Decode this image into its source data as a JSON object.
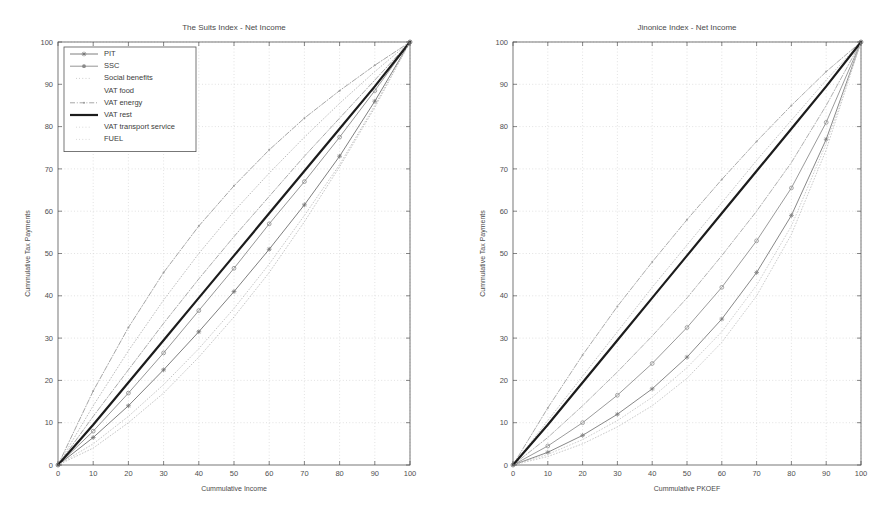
{
  "figure": {
    "width": 887,
    "height": 523,
    "background": "#ffffff"
  },
  "chart_data": [
    {
      "id": "left",
      "type": "line",
      "title": "The Suits Index - Net Income",
      "xlabel": "Cummulative Income",
      "ylabel": "Cummulative Tax Payments",
      "xlim": [
        0,
        100
      ],
      "ylim": [
        0,
        100
      ],
      "xticks": [
        0,
        10,
        20,
        30,
        40,
        50,
        60,
        70,
        80,
        90,
        100
      ],
      "yticks": [
        0,
        10,
        20,
        30,
        40,
        50,
        60,
        70,
        80,
        90,
        100
      ],
      "grid": true,
      "legend_position": "upper-left",
      "x": [
        0,
        10,
        20,
        30,
        40,
        50,
        60,
        70,
        80,
        90,
        100
      ],
      "series": [
        {
          "name": "PIT",
          "color": "#707070",
          "style": "solid",
          "marker": "star",
          "width": 0.9,
          "values": [
            0,
            6.5,
            14.0,
            22.5,
            31.5,
            41.0,
            51.0,
            61.5,
            73.0,
            86.0,
            100
          ]
        },
        {
          "name": "SSC",
          "color": "#8a8a8a",
          "style": "solid",
          "marker": "circle",
          "width": 0.9,
          "values": [
            0,
            8.0,
            17.0,
            26.5,
            36.5,
            46.5,
            57.0,
            67.0,
            77.5,
            88.5,
            100
          ]
        },
        {
          "name": "Social benefits",
          "color": "#b5b5b5",
          "style": "dotted",
          "marker": "none",
          "width": 0.9,
          "values": [
            0,
            14.0,
            27.0,
            39.0,
            50.0,
            60.0,
            69.0,
            77.5,
            85.5,
            93.0,
            100
          ]
        },
        {
          "name": "VAT food",
          "color": "#a0a0a0",
          "style": "dashdot",
          "marker": "none",
          "width": 0.9,
          "values": [
            0,
            11.5,
            22.5,
            33.5,
            44.0,
            54.0,
            63.5,
            73.0,
            82.0,
            91.0,
            100
          ]
        },
        {
          "name": "VAT energy",
          "color": "#9c9c9c",
          "style": "dashdot",
          "marker": "dot",
          "width": 0.9,
          "values": [
            0,
            17.5,
            32.5,
            45.5,
            56.5,
            66.0,
            74.5,
            82.0,
            88.5,
            94.5,
            100
          ]
        },
        {
          "name": "VAT rest",
          "color": "#1c1c1c",
          "style": "solid",
          "marker": "none",
          "width": 2.2,
          "values": [
            0,
            9.5,
            19.5,
            29.5,
            39.5,
            49.5,
            59.5,
            69.5,
            79.5,
            89.5,
            100
          ]
        },
        {
          "name": "VAT transport service",
          "color": "#c0c0c0",
          "style": "dotted",
          "marker": "none",
          "width": 0.9,
          "values": [
            0,
            5.0,
            11.5,
            19.0,
            27.5,
            37.0,
            47.5,
            59.0,
            71.0,
            85.0,
            100
          ]
        },
        {
          "name": "FUEL",
          "color": "#bdbdbd",
          "style": "dotted",
          "marker": "none",
          "width": 0.9,
          "values": [
            0,
            4.0,
            10.0,
            17.0,
            25.5,
            35.0,
            45.5,
            57.5,
            70.5,
            84.5,
            100
          ]
        }
      ]
    },
    {
      "id": "right",
      "type": "line",
      "title": "Jinonice Index - Net Income",
      "xlabel": "Cummulative PKOEF",
      "ylabel": "Cummulative Tax Payments",
      "xlim": [
        0,
        100
      ],
      "ylim": [
        0,
        100
      ],
      "xticks": [
        0,
        10,
        20,
        30,
        40,
        50,
        60,
        70,
        80,
        90,
        100
      ],
      "yticks": [
        0,
        10,
        20,
        30,
        40,
        50,
        60,
        70,
        80,
        90,
        100
      ],
      "grid": true,
      "legend_position": "none",
      "x": [
        0,
        10,
        20,
        30,
        40,
        50,
        60,
        70,
        80,
        90,
        100
      ],
      "series": [
        {
          "name": "PIT",
          "color": "#7a7a7a",
          "style": "solid",
          "marker": "star",
          "width": 0.9,
          "values": [
            0,
            3.0,
            7.0,
            12.0,
            18.0,
            25.5,
            34.5,
            45.5,
            59.0,
            77.0,
            100
          ]
        },
        {
          "name": "SSC",
          "color": "#909090",
          "style": "solid",
          "marker": "circle",
          "width": 0.9,
          "values": [
            0,
            4.5,
            10.0,
            16.5,
            24.0,
            32.5,
            42.0,
            53.0,
            65.5,
            81.0,
            100
          ]
        },
        {
          "name": "Social benefits",
          "color": "#bcbcbc",
          "style": "dotted",
          "marker": "none",
          "width": 0.9,
          "values": [
            0,
            10.5,
            21.0,
            31.5,
            42.0,
            52.0,
            62.0,
            72.0,
            81.5,
            91.0,
            100
          ]
        },
        {
          "name": "VAT food",
          "color": "#a8a8a8",
          "style": "dashdot",
          "marker": "none",
          "width": 0.9,
          "values": [
            0,
            6.5,
            14.0,
            22.0,
            30.5,
            39.5,
            49.5,
            60.0,
            71.5,
            85.0,
            100
          ]
        },
        {
          "name": "VAT energy",
          "color": "#a2a2a2",
          "style": "dashdot",
          "marker": "dot",
          "width": 0.9,
          "values": [
            0,
            13.5,
            26.0,
            37.5,
            48.0,
            58.0,
            67.5,
            76.5,
            85.0,
            93.0,
            100
          ]
        },
        {
          "name": "VAT rest",
          "color": "#1c1c1c",
          "style": "solid",
          "marker": "none",
          "width": 2.2,
          "values": [
            0,
            9.5,
            19.5,
            29.5,
            39.5,
            49.5,
            59.5,
            69.5,
            79.5,
            89.5,
            100
          ]
        },
        {
          "name": "VAT transport service",
          "color": "#c4c4c4",
          "style": "dotted",
          "marker": "none",
          "width": 0.9,
          "values": [
            0,
            2.0,
            5.0,
            9.0,
            14.0,
            20.5,
            29.0,
            40.0,
            54.5,
            74.5,
            100
          ]
        },
        {
          "name": "FUEL",
          "color": "#c8c8c8",
          "style": "dotted",
          "marker": "none",
          "width": 0.9,
          "values": [
            0,
            2.5,
            6.0,
            10.5,
            16.0,
            23.0,
            31.5,
            42.5,
            56.5,
            76.0,
            100
          ]
        }
      ]
    }
  ],
  "legend": {
    "items": [
      {
        "label": "PIT",
        "sample": "line-marker-star"
      },
      {
        "label": "SSC",
        "sample": "line-marker-circle"
      },
      {
        "label": "Social benefits",
        "sample": "dotted"
      },
      {
        "label": "VAT food",
        "sample": "blank"
      },
      {
        "label": "VAT energy",
        "sample": "dashdot-dot"
      },
      {
        "label": "VAT rest",
        "sample": "solid-thick"
      },
      {
        "label": "VAT transport service",
        "sample": "faint-dotted"
      },
      {
        "label": "FUEL",
        "sample": "faint-dotted"
      }
    ]
  },
  "colors": {
    "axis": "#555555",
    "grid": "#cfcfcf",
    "text": "#444444",
    "emphasis": "#1c1c1c",
    "background": "#ffffff"
  }
}
